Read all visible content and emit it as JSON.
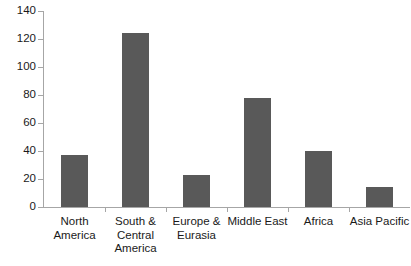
{
  "chart_data": {
    "type": "bar",
    "title": "",
    "xlabel": "",
    "ylabel": "",
    "categories": [
      "North America",
      "South & Central America",
      "Europe & Eurasia",
      "Middle East",
      "Africa",
      "Asia Pacific"
    ],
    "values": [
      37,
      124,
      23,
      78,
      40,
      14
    ],
    "ylim": [
      0,
      140
    ],
    "yticks": [
      0,
      20,
      40,
      60,
      80,
      100,
      120,
      140
    ],
    "ytick_labels": [
      "0",
      "20",
      "40",
      "60",
      "80",
      "100",
      "120",
      "140"
    ],
    "grid": false,
    "legend": null,
    "bar_color": "#595959",
    "axis_color": "#a6a6a6",
    "text_color": "#1a1a1a",
    "background_color": "#ffffff"
  }
}
